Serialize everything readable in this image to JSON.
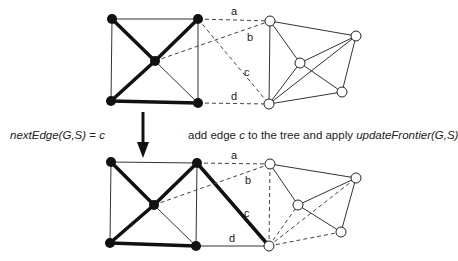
{
  "left_caption": {
    "func": "nextEdge",
    "args": "(G,S)",
    "eq": " = ",
    "value": "c"
  },
  "right_caption": {
    "part1": "add edge ",
    "edge": "c",
    "part2": " to the tree and apply ",
    "func": "updateFrontier",
    "args": "(G,S)"
  },
  "edge_labels": [
    "a",
    "b",
    "c",
    "d"
  ],
  "colors": {
    "tree_edge": "#111111",
    "graph_edge": "#333333",
    "frontier_edge": "#444444",
    "tree_node": "#111111",
    "non_tree_node_fill": "#ffffff",
    "non_tree_node_stroke": "#222222"
  },
  "top_graph": {
    "tree_nodes": [
      [
        112,
        19
      ],
      [
        198,
        19
      ],
      [
        155,
        61
      ],
      [
        111,
        101
      ],
      [
        198,
        103
      ]
    ],
    "other_nodes": [
      [
        270,
        21
      ],
      [
        356,
        36
      ],
      [
        300,
        63
      ],
      [
        342,
        92
      ],
      [
        269,
        104
      ]
    ]
  },
  "bottom_graph": {
    "tree_nodes": [
      [
        111,
        162
      ],
      [
        197,
        163
      ],
      [
        154,
        205
      ],
      [
        110,
        243
      ],
      [
        196,
        246
      ],
      [
        269,
        246
      ]
    ],
    "other_nodes": [
      [
        270,
        164
      ],
      [
        356,
        178
      ],
      [
        298,
        205
      ],
      [
        341,
        232
      ]
    ]
  }
}
